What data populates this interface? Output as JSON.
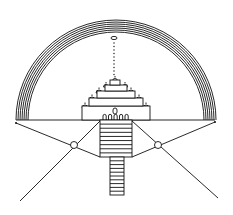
{
  "diagram": {
    "title": "",
    "elements": {
      "rainbow_arc": {
        "center": [
          116,
          120
        ],
        "radii": [
          100,
          98,
          96,
          94,
          92,
          90,
          88
        ],
        "color": "#111111"
      },
      "horizon_line": {
        "x1": 16,
        "x2": 215,
        "y": 120
      },
      "endpoints": [
        [
          16,
          123
        ],
        [
          215,
          122
        ]
      ],
      "top_ellipse": {
        "cx": 114,
        "cy": 38,
        "rx": 3,
        "ry": 1.6
      },
      "dotted_line": {
        "x": 114,
        "y1": 43,
        "y2": 77,
        "dot_spacing": 3.5
      },
      "temple_tiers": [
        {
          "x": 82,
          "y": 106,
          "w": 68,
          "h": 14
        },
        {
          "x": 89,
          "y": 98,
          "w": 54,
          "h": 8
        },
        {
          "x": 97,
          "y": 91,
          "w": 38,
          "h": 7
        },
        {
          "x": 105,
          "y": 85,
          "w": 22,
          "h": 6
        },
        {
          "x": 110,
          "y": 80,
          "w": 10,
          "h": 5
        }
      ],
      "domes": [
        {
          "cx": 85,
          "cy": 107,
          "r": 3
        },
        {
          "cx": 146,
          "cy": 107,
          "r": 3
        },
        {
          "cx": 92,
          "cy": 99,
          "r": 3
        },
        {
          "cx": 139,
          "cy": 99,
          "r": 3
        },
        {
          "cx": 99,
          "cy": 92,
          "r": 3
        },
        {
          "cx": 131,
          "cy": 92,
          "r": 3
        },
        {
          "cx": 106,
          "cy": 86,
          "r": 2.5
        },
        {
          "cx": 125,
          "cy": 86,
          "r": 2.5
        },
        {
          "cx": 115,
          "cy": 80,
          "r": 2.5
        }
      ],
      "arches_count": 5,
      "wide_stairs": {
        "x": 100,
        "y": 120,
        "w": 32,
        "h": 37,
        "steps": 9
      },
      "narrow_stairs": {
        "x": 110,
        "y": 157,
        "w": 14,
        "h": 38,
        "steps": 10
      },
      "sight_circles": [
        [
          74,
          145
        ],
        [
          158,
          145
        ]
      ]
    }
  }
}
